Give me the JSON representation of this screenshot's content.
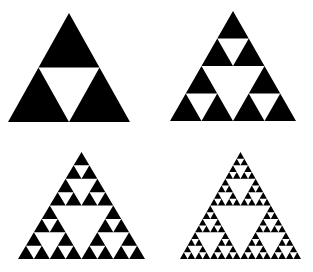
{
  "figure": {
    "background_color": "#ffffff",
    "ink_color": "#000000",
    "width": 313,
    "height": 272,
    "layout": "2x2 grid"
  },
  "chart_data": {
    "type": "diagram",
    "subtitle": "",
    "xlabel": "",
    "ylabel": "",
    "grid": false,
    "legend": false,
    "shape": "equilateral-triangle",
    "fill_color": "#000000",
    "background_color": "#ffffff",
    "categories": [
      "Iteration 1",
      "Iteration 2",
      "Iteration 3",
      "Iteration 4"
    ],
    "values": [
      1,
      2,
      3,
      4
    ],
    "series": [
      {
        "name": "Black sub-triangles",
        "values": [
          3,
          9,
          27,
          81
        ]
      },
      {
        "name": "White holes",
        "values": [
          1,
          4,
          13,
          40
        ]
      }
    ],
    "annotations": [
      "Each iteration removes the central inverted triangle from every remaining black triangle",
      "Number of filled triangles follows 3 to the power of n"
    ],
    "panels": [
      {
        "id": "panel-1",
        "label": "Iteration 1",
        "depth": 1,
        "filled_triangles": 3,
        "holes": 1,
        "x": 8,
        "y": 13,
        "width": 122,
        "height": 109
      },
      {
        "id": "panel-2",
        "label": "Iteration 2",
        "depth": 2,
        "filled_triangles": 9,
        "holes": 4,
        "x": 170,
        "y": 11,
        "width": 126,
        "height": 110
      },
      {
        "id": "panel-3",
        "label": "Iteration 3",
        "depth": 3,
        "filled_triangles": 27,
        "holes": 13,
        "x": 18,
        "y": 152,
        "width": 127,
        "height": 107
      },
      {
        "id": "panel-4",
        "label": "Iteration 4",
        "depth": 4,
        "filled_triangles": 81,
        "holes": 40,
        "x": 180,
        "y": 152,
        "width": 121,
        "height": 107
      }
    ]
  }
}
